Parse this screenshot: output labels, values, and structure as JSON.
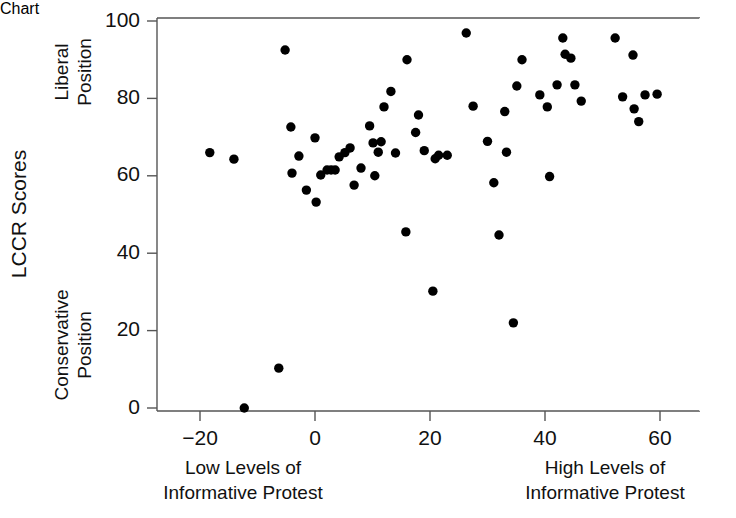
{
  "chart_data": {
    "type": "scatter",
    "title": "",
    "xlabel": "Informative Protest",
    "ylabel": "LCCR Scores",
    "xlim": [
      -28,
      70
    ],
    "ylim": [
      -3,
      101
    ],
    "grid": false,
    "legend": null,
    "x_ticks": [
      -20,
      0,
      20,
      40,
      60
    ],
    "x_tick_labels": [
      "-20",
      "0",
      "20",
      "40",
      "60"
    ],
    "y_ticks": [
      0,
      20,
      40,
      60,
      80,
      100
    ],
    "y_tick_labels": [
      "0",
      "20",
      "40",
      "60",
      "80",
      "100"
    ],
    "annotations": {
      "y_axis_top": "Liberal\nPosition",
      "y_axis_top_line1": "Liberal",
      "y_axis_top_line2": "Position",
      "y_axis_bottom_line1": "Conservative",
      "y_axis_bottom_line2": "Position",
      "x_axis_left_line1": "Low Levels of",
      "x_axis_left_line2": "Informative Protest",
      "x_axis_right_line1": "High Levels of",
      "x_axis_right_line2": "Informative Protest"
    },
    "marker": {
      "shape": "circle",
      "color": "#000000",
      "size_px": 5
    },
    "points": [
      {
        "x": -18.3,
        "y": 66.0
      },
      {
        "x": -14.1,
        "y": 64.3
      },
      {
        "x": -12.3,
        "y": 0.0
      },
      {
        "x": -6.3,
        "y": 10.3
      },
      {
        "x": -5.2,
        "y": 92.5
      },
      {
        "x": -4.2,
        "y": 72.6
      },
      {
        "x": -4.0,
        "y": 60.7
      },
      {
        "x": -2.8,
        "y": 65.1
      },
      {
        "x": -1.5,
        "y": 56.3
      },
      {
        "x": 0.0,
        "y": 69.8
      },
      {
        "x": 0.2,
        "y": 53.2
      },
      {
        "x": 1.0,
        "y": 60.2
      },
      {
        "x": 2.1,
        "y": 61.5
      },
      {
        "x": 2.8,
        "y": 61.5
      },
      {
        "x": 3.5,
        "y": 61.5
      },
      {
        "x": 4.2,
        "y": 64.9
      },
      {
        "x": 5.2,
        "y": 66.0
      },
      {
        "x": 6.1,
        "y": 67.2
      },
      {
        "x": 6.8,
        "y": 57.6
      },
      {
        "x": 8.0,
        "y": 62.0
      },
      {
        "x": 9.5,
        "y": 72.9
      },
      {
        "x": 10.1,
        "y": 68.5
      },
      {
        "x": 10.4,
        "y": 60.0
      },
      {
        "x": 11.0,
        "y": 66.1
      },
      {
        "x": 11.5,
        "y": 68.8
      },
      {
        "x": 12.0,
        "y": 77.8
      },
      {
        "x": 13.2,
        "y": 81.8
      },
      {
        "x": 14.0,
        "y": 65.9
      },
      {
        "x": 15.8,
        "y": 45.5
      },
      {
        "x": 16.0,
        "y": 90.0
      },
      {
        "x": 17.5,
        "y": 71.2
      },
      {
        "x": 18.0,
        "y": 75.7
      },
      {
        "x": 19.0,
        "y": 66.5
      },
      {
        "x": 20.5,
        "y": 30.2
      },
      {
        "x": 20.9,
        "y": 64.4
      },
      {
        "x": 21.5,
        "y": 65.3
      },
      {
        "x": 23.0,
        "y": 65.3
      },
      {
        "x": 26.3,
        "y": 96.9
      },
      {
        "x": 27.5,
        "y": 78.0
      },
      {
        "x": 30.0,
        "y": 68.9
      },
      {
        "x": 31.1,
        "y": 58.2
      },
      {
        "x": 32.0,
        "y": 44.7
      },
      {
        "x": 33.0,
        "y": 76.6
      },
      {
        "x": 33.3,
        "y": 66.1
      },
      {
        "x": 34.5,
        "y": 22.0
      },
      {
        "x": 35.1,
        "y": 83.2
      },
      {
        "x": 36.0,
        "y": 90.0
      },
      {
        "x": 39.1,
        "y": 80.9
      },
      {
        "x": 40.4,
        "y": 77.8
      },
      {
        "x": 40.8,
        "y": 59.8
      },
      {
        "x": 42.1,
        "y": 83.5
      },
      {
        "x": 43.1,
        "y": 95.6
      },
      {
        "x": 43.5,
        "y": 91.4
      },
      {
        "x": 44.5,
        "y": 90.4
      },
      {
        "x": 45.2,
        "y": 83.5
      },
      {
        "x": 46.3,
        "y": 79.3
      },
      {
        "x": 52.2,
        "y": 95.6
      },
      {
        "x": 53.5,
        "y": 80.4
      },
      {
        "x": 55.3,
        "y": 91.2
      },
      {
        "x": 55.5,
        "y": 77.3
      },
      {
        "x": 56.3,
        "y": 74.0
      },
      {
        "x": 57.4,
        "y": 80.9
      },
      {
        "x": 59.5,
        "y": 81.1
      }
    ]
  }
}
